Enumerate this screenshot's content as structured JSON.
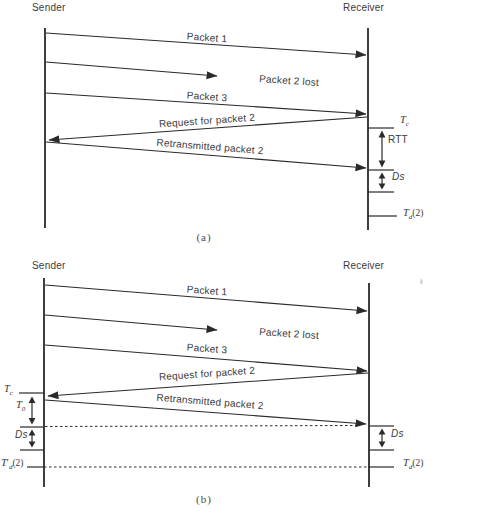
{
  "colors": {
    "line": "#2a2a2a",
    "text": "#3b3b3b",
    "background": "#ffffff"
  },
  "panels": {
    "a": {
      "sender": "Sender",
      "receiver": "Receiver",
      "packet1": "Packet 1",
      "packet2_lost": "Packet 2 lost",
      "packet3": "Packet 3",
      "request": "Request for packet 2",
      "retransmit": "Retransmitted packet 2",
      "rtt": "RTT",
      "ds": "Ds",
      "t_c": {
        "base": "T",
        "sub": "c"
      },
      "t_d2": {
        "base": "T",
        "sub": "d",
        "args": "(2)"
      },
      "caption": "(a)"
    },
    "b": {
      "sender": "Sender",
      "receiver": "Receiver",
      "packet1": "Packet 1",
      "packet2_lost": "Packet 2 lost",
      "packet3": "Packet 3",
      "request": "Request for packet 2",
      "retransmit": "Retransmitted packet 2",
      "t_c": {
        "base": "T",
        "sub": "c"
      },
      "t_0": {
        "base": "T",
        "sub": "0"
      },
      "ds_left": "Ds",
      "ds_right": "Ds",
      "t_prime_d2": {
        "base": "T",
        "prime": "′",
        "sub": "d",
        "args": "(2)"
      },
      "t_d2": {
        "base": "T",
        "sub": "d",
        "args": "(2)"
      },
      "caption": "(b)"
    }
  }
}
